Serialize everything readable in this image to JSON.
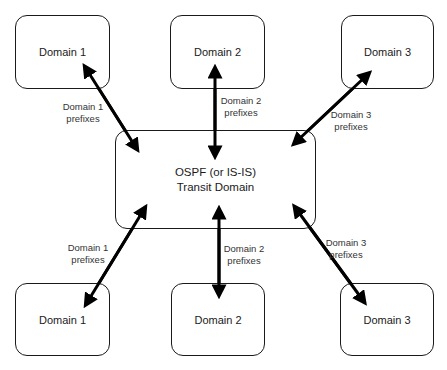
{
  "diagram": {
    "center": {
      "label": "OSPF (or IS-IS)\nTransit Domain"
    },
    "top_boxes": [
      {
        "label": "Domain 1"
      },
      {
        "label": "Domain 2"
      },
      {
        "label": "Domain 3"
      }
    ],
    "bottom_boxes": [
      {
        "label": "Domain 1"
      },
      {
        "label": "Domain 2"
      },
      {
        "label": "Domain 3"
      }
    ],
    "top_links": [
      {
        "label": "Domain 1\nprefixes"
      },
      {
        "label": "Domain 2\nprefixes"
      },
      {
        "label": "Domain 3\nprefixes"
      }
    ],
    "bottom_links": [
      {
        "label": "Domain 1\nprefixes"
      },
      {
        "label": "Domain 2\nprefixes"
      },
      {
        "label": "Domain 3\nprefixes"
      }
    ],
    "colors": {
      "stroke": "#1a1a1a",
      "arrow": "#000000",
      "text": "#1a1a1a"
    }
  }
}
